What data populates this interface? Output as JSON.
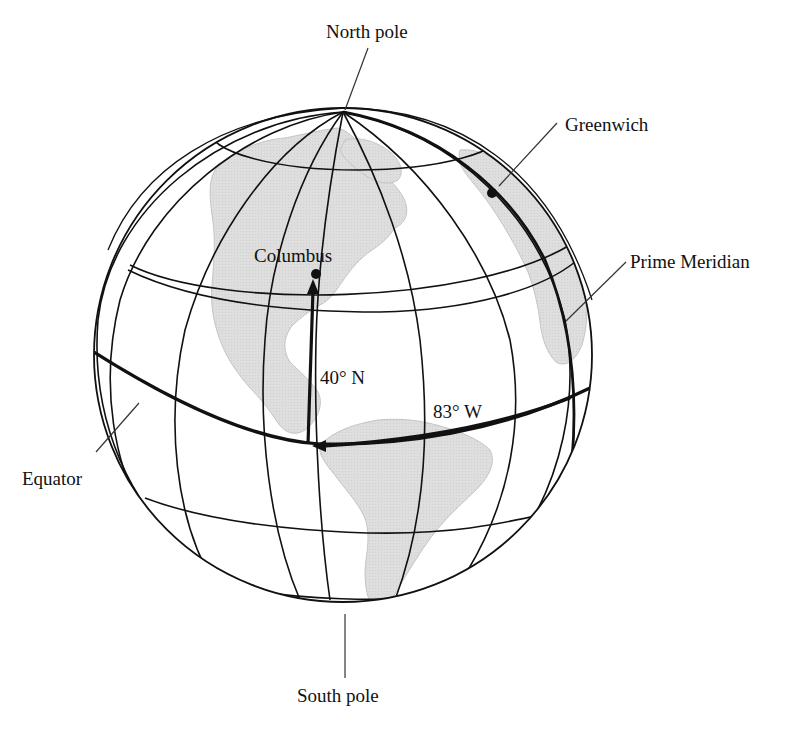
{
  "figure": {
    "labels": {
      "north_pole": "North pole",
      "south_pole": "South pole",
      "greenwich": "Greenwich",
      "prime_meridian": "Prime Meridian",
      "equator": "Equator",
      "columbus": "Columbus",
      "latitude": "40° N",
      "longitude": "83° W"
    },
    "colors": {
      "land": "#dcdcdc",
      "line": "#111111",
      "background": "#ffffff"
    }
  }
}
